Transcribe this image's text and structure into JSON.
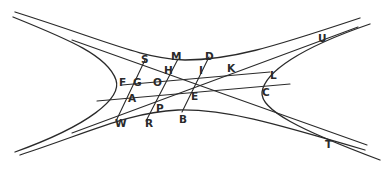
{
  "figure": {
    "stroke_color": "#2a2a2a",
    "background": "#ffffff"
  },
  "labels": {
    "S": "S",
    "M": "M",
    "D": "D",
    "U": "U",
    "H": "H",
    "I": "I",
    "K": "K",
    "L": "L",
    "F": "F",
    "G": "G",
    "O": "O",
    "E": "E",
    "C": "C",
    "A": "A",
    "P": "P",
    "B": "B",
    "W": "W",
    "R": "R",
    "T": "T"
  }
}
